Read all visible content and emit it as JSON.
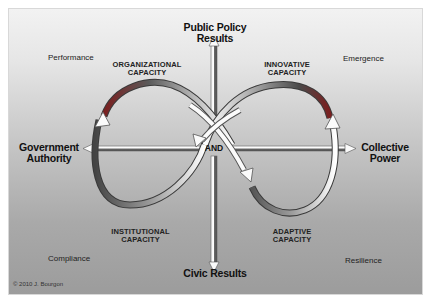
{
  "diagram": {
    "axes": {
      "top": {
        "line1": "Public Policy",
        "line2": "Results"
      },
      "bottom": {
        "label": "Civic Results"
      },
      "left": {
        "line1": "Government",
        "line2": "Authority"
      },
      "right": {
        "line1": "Collective",
        "line2": "Power"
      },
      "center": "AND"
    },
    "capacities": {
      "organizational": {
        "line1": "ORGANIZATIONAL",
        "line2": "CAPACITY"
      },
      "innovative": {
        "line1": "INNOVATIVE",
        "line2": "CAPACITY"
      },
      "institutional": {
        "line1": "INSTITUTIONAL",
        "line2": "CAPACITY"
      },
      "adaptive": {
        "line1": "ADAPTIVE",
        "line2": "CAPACITY"
      }
    },
    "quadrants": {
      "top_left": "Performance",
      "top_right": "Emergence",
      "bottom_left": "Compliance",
      "bottom_right": "Resilience"
    },
    "copyright": "© 2010 J. Bourgon",
    "colors": {
      "background_top": "#f2f2f2",
      "background_bottom": "#9c9c9c",
      "arrow_fill": "#f5f5f5",
      "arrow_outline": "#555555",
      "arc_dark": "#3a3a3a",
      "axis_dark": "#5a5a5a"
    }
  }
}
